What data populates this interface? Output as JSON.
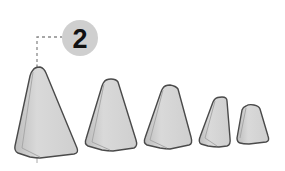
{
  "diagram": {
    "callout": {
      "label": "2",
      "circle_fill": "#cfcfcf",
      "text_color": "#111111"
    },
    "shapes": [
      {
        "name": "block-1",
        "size": "largest"
      },
      {
        "name": "block-2",
        "size": "large"
      },
      {
        "name": "block-3",
        "size": "medium"
      },
      {
        "name": "block-4",
        "size": "small"
      },
      {
        "name": "block-5",
        "size": "smallest"
      }
    ],
    "colors": {
      "face_light": "#d6d6d6",
      "face_dark": "#b5b5b5",
      "outline": "#4a4a4a",
      "leader_line": "#8a8a8a"
    }
  }
}
